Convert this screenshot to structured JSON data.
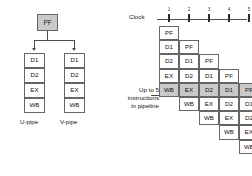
{
  "figure": {
    "title_hidden": "",
    "accent_shade": "#c9c9c9",
    "line_color": "#4d4d4d"
  },
  "left_diagram": {
    "prefetch": {
      "label": "PF"
    },
    "pipes": [
      {
        "name": "u-pipe",
        "caption": "U-pipe",
        "stages": [
          {
            "label": "D1"
          },
          {
            "label": "D2"
          },
          {
            "label": "EX"
          },
          {
            "label": "WB"
          }
        ]
      },
      {
        "name": "v-pipe",
        "caption": "V-pipe",
        "stages": [
          {
            "label": "D1"
          },
          {
            "label": "D2"
          },
          {
            "label": "EX"
          },
          {
            "label": "WB"
          }
        ]
      }
    ]
  },
  "right_diagram": {
    "clock": {
      "label": "Clock",
      "ticks": [
        "1",
        "2",
        "3",
        "4",
        "5"
      ]
    },
    "annotation": {
      "line1": "Up to 5",
      "line2": "instructions",
      "line3": "in pipeline"
    },
    "stage_sequence": [
      "PF",
      "D1",
      "D2",
      "EX",
      "WB"
    ],
    "highlighted_row_index": 4,
    "columns": [
      {
        "index": 1,
        "start_row": 0,
        "cells": [
          {
            "label": "PF",
            "row": 0,
            "shaded": false
          },
          {
            "label": "D1",
            "row": 1,
            "shaded": false
          },
          {
            "label": "D2",
            "row": 2,
            "shaded": false
          },
          {
            "label": "EX",
            "row": 3,
            "shaded": false
          },
          {
            "label": "WB",
            "row": 4,
            "shaded": true
          }
        ]
      },
      {
        "index": 2,
        "start_row": 1,
        "cells": [
          {
            "label": "PF",
            "row": 1,
            "shaded": false
          },
          {
            "label": "D1",
            "row": 2,
            "shaded": false
          },
          {
            "label": "D2",
            "row": 3,
            "shaded": false
          },
          {
            "label": "EX",
            "row": 4,
            "shaded": true
          },
          {
            "label": "WB",
            "row": 5,
            "shaded": false
          }
        ]
      },
      {
        "index": 3,
        "start_row": 2,
        "cells": [
          {
            "label": "PF",
            "row": 2,
            "shaded": false
          },
          {
            "label": "D1",
            "row": 3,
            "shaded": false
          },
          {
            "label": "D2",
            "row": 4,
            "shaded": true
          },
          {
            "label": "EX",
            "row": 5,
            "shaded": false
          },
          {
            "label": "WB",
            "row": 6,
            "shaded": false
          }
        ]
      },
      {
        "index": 4,
        "start_row": 3,
        "cells": [
          {
            "label": "PF",
            "row": 3,
            "shaded": false
          },
          {
            "label": "D1",
            "row": 4,
            "shaded": true
          },
          {
            "label": "D2",
            "row": 5,
            "shaded": false
          },
          {
            "label": "EX",
            "row": 6,
            "shaded": false
          },
          {
            "label": "WB",
            "row": 7,
            "shaded": false
          }
        ]
      },
      {
        "index": 5,
        "start_row": 4,
        "cells": [
          {
            "label": "PF",
            "row": 4,
            "shaded": true
          },
          {
            "label": "D1",
            "row": 5,
            "shaded": false
          },
          {
            "label": "D2",
            "row": 6,
            "shaded": false
          },
          {
            "label": "EX",
            "row": 7,
            "shaded": false
          },
          {
            "label": "WB",
            "row": 8,
            "shaded": false
          }
        ]
      }
    ]
  }
}
